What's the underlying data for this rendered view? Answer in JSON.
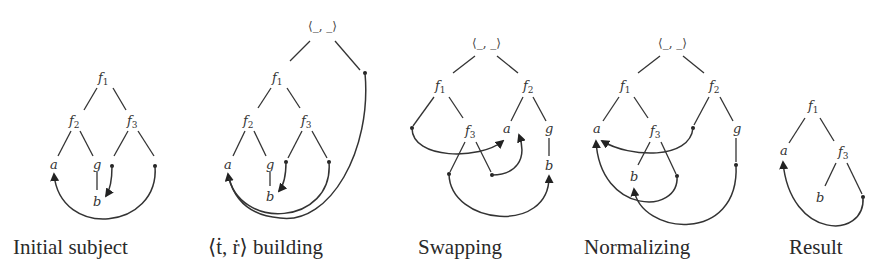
{
  "figure": {
    "panels": [
      {
        "id": "initial-subject",
        "caption": "Initial subject",
        "nodes": {
          "root": "f",
          "root_sub": "1",
          "left": "f",
          "left_sub": "2",
          "right": "f",
          "right_sub": "3",
          "a": "a",
          "g": "g",
          "b": "b"
        }
      },
      {
        "id": "tr-building",
        "caption": "⟨ṫ, ṙ⟩ building",
        "nodes": {
          "pair": "⟨_, _⟩",
          "root": "f",
          "root_sub": "1",
          "left": "f",
          "left_sub": "2",
          "right": "f",
          "right_sub": "3",
          "a": "a",
          "g": "g",
          "b": "b"
        }
      },
      {
        "id": "swapping",
        "caption": "Swapping",
        "nodes": {
          "pair": "⟨_, _⟩",
          "f1": "f",
          "f1_sub": "1",
          "f2": "f",
          "f2_sub": "2",
          "f3": "f",
          "f3_sub": "3",
          "a": "a",
          "g": "g",
          "b": "b"
        }
      },
      {
        "id": "normalizing",
        "caption": "Normalizing",
        "nodes": {
          "pair": "⟨_, _⟩",
          "f1": "f",
          "f1_sub": "1",
          "f2": "f",
          "f2_sub": "2",
          "f3": "f",
          "f3_sub": "3",
          "a": "a",
          "g": "g",
          "b": "b"
        }
      },
      {
        "id": "result",
        "caption": "Result",
        "nodes": {
          "f1": "f",
          "f1_sub": "1",
          "f3": "f",
          "f3_sub": "3",
          "a": "a",
          "b": "b"
        }
      }
    ]
  }
}
